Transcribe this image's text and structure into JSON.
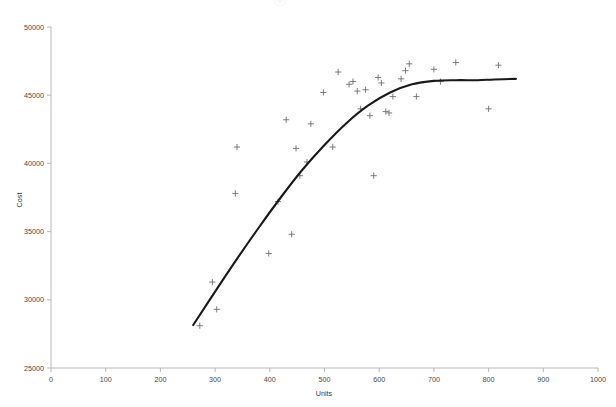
{
  "chart_data": {
    "type": "scatter",
    "title": "",
    "xlabel": "Units",
    "ylabel": "Cost",
    "xlim": [
      0,
      1000
    ],
    "ylim": [
      25000,
      50000
    ],
    "xticks": [
      0,
      100,
      200,
      300,
      400,
      500,
      600,
      700,
      800,
      900,
      1000
    ],
    "xtick_labels": [
      "0",
      "100",
      "200",
      "300",
      "400",
      "500",
      "600",
      "700",
      "800",
      "900",
      "1000"
    ],
    "yticks": [
      25000,
      30000,
      35000,
      40000,
      45000,
      50000
    ],
    "ytick_labels": [
      "25000",
      "30000",
      "35000",
      "40000",
      "45000",
      "50000"
    ],
    "grid": false,
    "legend": null,
    "marker_style": "plus",
    "marker_color": "#707070",
    "curve_color": "#1a1a1a",
    "axis_color": "#b8b8b8",
    "series": [
      {
        "name": "observations",
        "type": "scatter",
        "points": [
          [
            272,
            28100
          ],
          [
            295,
            31300
          ],
          [
            303,
            29300
          ],
          [
            337,
            37800
          ],
          [
            340,
            41200
          ],
          [
            398,
            33400
          ],
          [
            415,
            37200
          ],
          [
            430,
            43200
          ],
          [
            440,
            34800
          ],
          [
            448,
            41100
          ],
          [
            455,
            39100
          ],
          [
            468,
            40100
          ],
          [
            475,
            42900
          ],
          [
            498,
            45200
          ],
          [
            515,
            41200
          ],
          [
            525,
            46700
          ],
          [
            545,
            45800
          ],
          [
            552,
            46000
          ],
          [
            560,
            45300
          ],
          [
            566,
            44000
          ],
          [
            575,
            45400
          ],
          [
            583,
            43500
          ],
          [
            590,
            39100
          ],
          [
            598,
            46300
          ],
          [
            604,
            45900
          ],
          [
            612,
            43800
          ],
          [
            618,
            43700
          ],
          [
            625,
            44900
          ],
          [
            640,
            46200
          ],
          [
            648,
            46800
          ],
          [
            655,
            47300
          ],
          [
            668,
            44900
          ],
          [
            700,
            46900
          ],
          [
            712,
            46000
          ],
          [
            740,
            47400
          ],
          [
            800,
            44000
          ],
          [
            818,
            47200
          ]
        ]
      },
      {
        "name": "fitted-curve",
        "type": "line",
        "points": [
          [
            260,
            28150
          ],
          [
            300,
            30600
          ],
          [
            340,
            33000
          ],
          [
            380,
            35300
          ],
          [
            420,
            37500
          ],
          [
            460,
            39550
          ],
          [
            500,
            41350
          ],
          [
            540,
            42950
          ],
          [
            580,
            44250
          ],
          [
            620,
            45200
          ],
          [
            660,
            45800
          ],
          [
            700,
            46050
          ],
          [
            740,
            46100
          ],
          [
            780,
            46100
          ],
          [
            810,
            46150
          ],
          [
            850,
            46200
          ]
        ]
      }
    ]
  },
  "plot_geometry": {
    "left_px": 51,
    "right_px": 598,
    "top_px": 27,
    "bottom_px": 368
  }
}
